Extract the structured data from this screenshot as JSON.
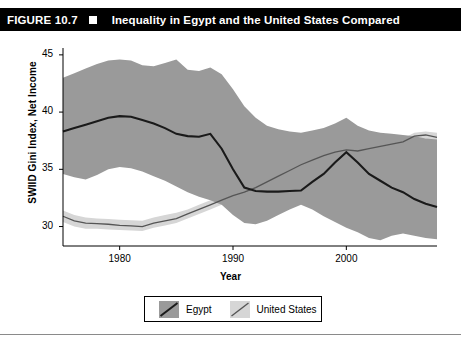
{
  "figure": {
    "number_label": "FIGURE 10.7",
    "bullet": "square-marker",
    "title": "Inequality in Egypt and the United States Compared"
  },
  "legend": {
    "items": [
      {
        "label": "Egypt",
        "swatch_color": "#9a9a9a",
        "line_color": "#1a1a1a"
      },
      {
        "label": "United States",
        "swatch_color": "#d6d6d6",
        "line_color": "#555555"
      }
    ]
  },
  "chart_data": {
    "type": "line",
    "title": "Inequality in Egypt and the United States Compared",
    "xlabel": "Year",
    "ylabel": "SWIID Gini Index, Net Income",
    "xlim": [
      1975,
      2008
    ],
    "ylim": [
      28.3,
      45.6
    ],
    "xticks": [
      1980,
      1990,
      2000
    ],
    "yticks": [
      30,
      35,
      40,
      45
    ],
    "grid": false,
    "legend_position": "bottom-center",
    "band_note": "shaded ribbons show uncertainty intervals around each series",
    "x": [
      1975,
      1976,
      1977,
      1978,
      1979,
      1980,
      1981,
      1982,
      1983,
      1984,
      1985,
      1986,
      1987,
      1988,
      1989,
      1990,
      1991,
      1992,
      1993,
      1994,
      1995,
      1996,
      1997,
      1998,
      1999,
      2000,
      2001,
      2002,
      2003,
      2004,
      2005,
      2006,
      2007,
      2008
    ],
    "series": [
      {
        "name": "Egypt",
        "color": "#1a1a1a",
        "band_color": "#9a9a9a",
        "values": [
          38.3,
          38.6,
          38.9,
          39.2,
          39.5,
          39.65,
          39.6,
          39.3,
          39.0,
          38.6,
          38.1,
          37.9,
          37.85,
          38.1,
          36.8,
          35.0,
          33.4,
          33.1,
          33.05,
          33.05,
          33.1,
          33.15,
          33.9,
          34.6,
          35.6,
          36.5,
          35.6,
          34.6,
          34.0,
          33.4,
          33.0,
          32.4,
          32.0,
          31.7
        ],
        "band_upper": [
          43.0,
          43.4,
          43.8,
          44.2,
          44.5,
          44.6,
          44.5,
          44.1,
          44.0,
          44.3,
          44.6,
          43.7,
          43.6,
          43.9,
          43.3,
          42.0,
          40.5,
          39.5,
          38.8,
          38.5,
          38.3,
          38.2,
          38.4,
          38.6,
          39.0,
          39.5,
          38.8,
          38.4,
          38.2,
          38.1,
          38.0,
          37.9,
          37.7,
          37.6
        ],
        "band_lower": [
          34.6,
          34.3,
          34.1,
          34.5,
          35.0,
          35.2,
          35.1,
          34.8,
          34.4,
          34.0,
          33.5,
          33.0,
          32.6,
          32.3,
          31.9,
          31.0,
          30.3,
          30.2,
          30.5,
          31.0,
          31.5,
          31.9,
          31.5,
          30.9,
          30.4,
          29.9,
          29.5,
          29.0,
          28.8,
          29.2,
          29.4,
          29.2,
          29.0,
          28.9
        ]
      },
      {
        "name": "United States",
        "color": "#555555",
        "band_color": "#d6d6d6",
        "values": [
          30.9,
          30.5,
          30.3,
          30.25,
          30.2,
          30.1,
          30.05,
          30.0,
          30.3,
          30.5,
          30.7,
          31.1,
          31.5,
          31.9,
          32.3,
          32.7,
          33.0,
          33.4,
          33.9,
          34.4,
          34.9,
          35.4,
          35.8,
          36.2,
          36.5,
          36.7,
          36.6,
          36.8,
          37.0,
          37.2,
          37.4,
          37.9,
          38.0,
          37.8
        ],
        "band_upper": [
          31.4,
          31.0,
          30.8,
          30.7,
          30.65,
          30.6,
          30.55,
          30.5,
          30.8,
          31.0,
          31.2,
          31.5,
          31.9,
          32.3,
          32.7,
          33.1,
          33.4,
          33.8,
          34.3,
          34.8,
          35.3,
          35.7,
          36.1,
          36.5,
          36.8,
          37.0,
          36.9,
          37.1,
          37.3,
          37.5,
          37.7,
          38.2,
          38.3,
          38.2
        ],
        "band_lower": [
          30.4,
          30.0,
          29.8,
          29.8,
          29.75,
          29.7,
          29.65,
          29.6,
          29.9,
          30.1,
          30.3,
          30.7,
          31.1,
          31.5,
          31.9,
          32.3,
          32.6,
          33.0,
          33.5,
          34.0,
          34.5,
          35.0,
          35.4,
          35.8,
          36.2,
          36.4,
          36.3,
          36.5,
          36.7,
          36.9,
          37.1,
          37.6,
          37.7,
          37.4
        ]
      }
    ]
  }
}
